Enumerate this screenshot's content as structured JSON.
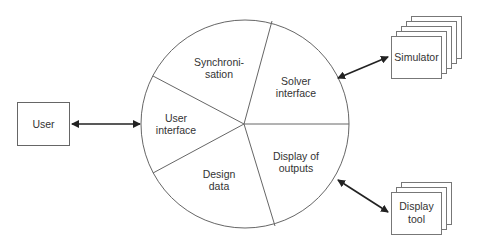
{
  "diagram": {
    "user_box": {
      "label": "User"
    },
    "segments": {
      "synchronisation": {
        "line1": "Synchroni-",
        "line2": "sation"
      },
      "solver_interface": {
        "line1": "Solver",
        "line2": "interface"
      },
      "display_of_outputs": {
        "line1": "Display of",
        "line2": "outputs"
      },
      "design_data": {
        "line1": "Design",
        "line2": "data"
      },
      "user_interface": {
        "line1": "User",
        "line2": "interface"
      }
    },
    "simulator": {
      "label": "Simulator",
      "stack_count": 5
    },
    "display_tool": {
      "line1": "Display",
      "line2": "tool",
      "stack_count": 3
    },
    "colors": {
      "stroke": "#555555",
      "arrow": "#222222",
      "text": "#333333"
    }
  }
}
